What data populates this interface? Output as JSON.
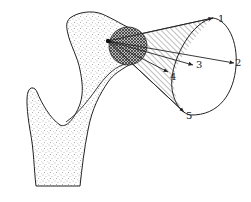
{
  "figure": {
    "type": "anatomical-diagram",
    "labels": [
      {
        "id": "1",
        "text": "1",
        "x": 218,
        "y": 22
      },
      {
        "id": "2",
        "text": "2",
        "x": 234,
        "y": 66
      },
      {
        "id": "3",
        "text": "3",
        "x": 196,
        "y": 68
      },
      {
        "id": "4",
        "text": "4",
        "x": 170,
        "y": 79
      },
      {
        "id": "5",
        "text": "5",
        "x": 185,
        "y": 118
      }
    ],
    "colors": {
      "outline": "#222222",
      "stipple": "#555555",
      "hatch": "#444444",
      "background": "#ffffff"
    },
    "caption": ""
  }
}
